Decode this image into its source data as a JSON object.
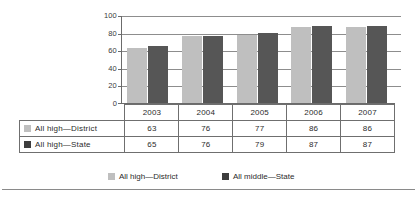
{
  "chart_data": {
    "type": "bar",
    "title": "",
    "xlabel": "",
    "ylabel": "",
    "categories": [
      "2003",
      "2004",
      "2005",
      "2006",
      "2007"
    ],
    "series": [
      {
        "name": "All high—District",
        "values": [
          63,
          76,
          77,
          86,
          86
        ],
        "color": "#bfbfbf"
      },
      {
        "name": "All high—State",
        "values": [
          65,
          76,
          79,
          87,
          87
        ],
        "color": "#565656"
      }
    ],
    "ylim": [
      0,
      100
    ],
    "yticks": [
      0,
      20,
      40,
      60,
      80,
      100
    ],
    "ytick_labels": [
      "0",
      "20",
      "40",
      "60",
      "80",
      "100"
    ],
    "grid": true,
    "legend_position": "bottom",
    "legend_entries": [
      {
        "label": "All high—District",
        "color": "#bfbfbf"
      },
      {
        "label": "All middle—State",
        "color": "#3d3d3d"
      }
    ],
    "data_table": {
      "column_headers": [
        "2003",
        "2004",
        "2005",
        "2006",
        "2007"
      ],
      "rows": [
        {
          "label": "All high—District",
          "swatch": "#bfbfbf",
          "values": [
            "63",
            "76",
            "77",
            "86",
            "86"
          ]
        },
        {
          "label": "All high—State",
          "swatch": "#3d3d3d",
          "values": [
            "65",
            "76",
            "79",
            "87",
            "87"
          ]
        }
      ]
    }
  },
  "colors": {
    "series_light": "#bfbfbf",
    "series_dark": "#565656",
    "gridline": "#8d8d8d",
    "axis": "#6b6b6b",
    "table_border": "#6f6f6f",
    "text": "#2b2b2b",
    "background": "#ffffff"
  }
}
